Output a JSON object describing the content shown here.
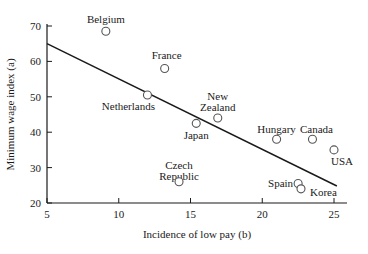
{
  "figure": {
    "background": "#ffffff",
    "text_color": "#1a1a1a",
    "marker_stroke": "#555555"
  },
  "chart_data": {
    "type": "scatter",
    "title": "",
    "xlabel": "Incidence of low pay (b)",
    "ylabel": "Minimum wage index (a)",
    "xlim": [
      5,
      25
    ],
    "ylim": [
      20,
      70
    ],
    "xticks": [
      5,
      10,
      15,
      20,
      25
    ],
    "yticks": [
      20,
      30,
      40,
      50,
      60,
      70
    ],
    "grid": false,
    "legend": "none",
    "marker": "open-circle",
    "points": [
      {
        "label": "Belgium",
        "x": 9.1,
        "y": 68.5,
        "label_lines": [
          "Belgium"
        ],
        "anchor": "middle",
        "dx": 0,
        "dy": -8
      },
      {
        "label": "France",
        "x": 13.2,
        "y": 58,
        "label_lines": [
          "France"
        ],
        "anchor": "middle",
        "dx": 2,
        "dy": -9
      },
      {
        "label": "Netherlands",
        "x": 12.0,
        "y": 50.5,
        "label_lines": [
          "Netherlands"
        ],
        "anchor": "middle",
        "dx": -19,
        "dy": 15
      },
      {
        "label": "New Zealand",
        "x": 16.9,
        "y": 44,
        "label_lines": [
          "New",
          "Zealand"
        ],
        "anchor": "middle",
        "dx": 0,
        "dy": -18
      },
      {
        "label": "Japan",
        "x": 15.4,
        "y": 42.5,
        "label_lines": [
          "Japan"
        ],
        "anchor": "middle",
        "dx": 0,
        "dy": 16
      },
      {
        "label": "Hungary",
        "x": 21.0,
        "y": 38,
        "label_lines": [
          "Hungary"
        ],
        "anchor": "middle",
        "dx": 0,
        "dy": -6
      },
      {
        "label": "Canada",
        "x": 23.5,
        "y": 38,
        "label_lines": [
          "Canada"
        ],
        "anchor": "middle",
        "dx": 4,
        "dy": -6
      },
      {
        "label": "USA",
        "x": 25.0,
        "y": 35,
        "label_lines": [
          "USA"
        ],
        "anchor": "middle",
        "dx": 8,
        "dy": 15
      },
      {
        "label": "Czech Republic",
        "x": 14.2,
        "y": 26,
        "label_lines": [
          "Czech",
          "Republic"
        ],
        "anchor": "middle",
        "dx": 0,
        "dy": -13
      },
      {
        "label": "Spain",
        "x": 22.5,
        "y": 25.5,
        "label_lines": [
          "Spain"
        ],
        "anchor": "end",
        "dx": -5,
        "dy": 3
      },
      {
        "label": "Korea",
        "x": 22.7,
        "y": 24,
        "label_lines": [
          "Korea"
        ],
        "anchor": "start",
        "dx": 9,
        "dy": 7
      }
    ],
    "trendline": {
      "x1": 5,
      "y1": 65,
      "x2": 25.2,
      "y2": 24.8
    }
  }
}
